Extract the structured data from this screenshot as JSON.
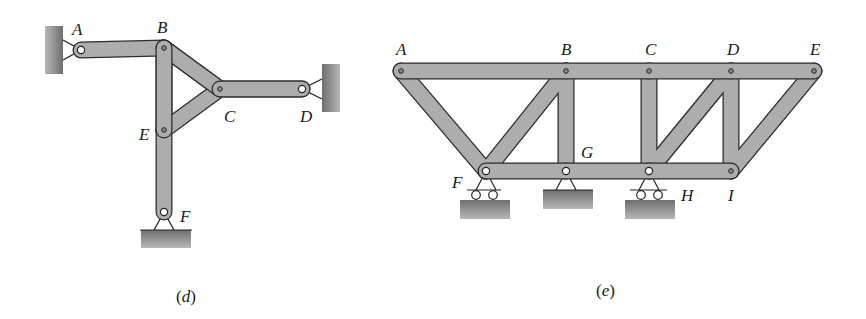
{
  "figures": [
    {
      "id": "d",
      "caption": "(d)",
      "caption_letter": "d",
      "joints": {
        "A": {
          "label": "A",
          "x": 81,
          "y": 50,
          "support": "pin-wall-left"
        },
        "B": {
          "label": "B",
          "x": 164,
          "y": 48
        },
        "C": {
          "label": "C",
          "x": 220,
          "y": 89
        },
        "D": {
          "label": "D",
          "x": 302,
          "y": 89,
          "support": "pin-wall-right"
        },
        "E": {
          "label": "E",
          "x": 164,
          "y": 130
        },
        "F": {
          "label": "F",
          "x": 164,
          "y": 212,
          "support": "pin-ground"
        }
      },
      "members": [
        [
          "A",
          "B"
        ],
        [
          "B",
          "E"
        ],
        [
          "E",
          "F"
        ],
        [
          "B",
          "C"
        ],
        [
          "E",
          "C"
        ],
        [
          "C",
          "D"
        ]
      ]
    },
    {
      "id": "e",
      "caption": "(e)",
      "caption_letter": "e",
      "joints": {
        "A": {
          "label": "A",
          "x": 401,
          "y": 71
        },
        "B": {
          "label": "B",
          "x": 566,
          "y": 71
        },
        "C": {
          "label": "C",
          "x": 649,
          "y": 71
        },
        "D": {
          "label": "D",
          "x": 731,
          "y": 71
        },
        "E": {
          "label": "E",
          "x": 814,
          "y": 71
        },
        "F": {
          "label": "F",
          "x": 486,
          "y": 171,
          "support": "roller"
        },
        "G": {
          "label": "G",
          "x": 566,
          "y": 171,
          "support": "pin"
        },
        "H": {
          "label": "H",
          "x": 649,
          "y": 171,
          "support": "roller"
        },
        "I": {
          "label": "I",
          "x": 731,
          "y": 171
        }
      },
      "members": [
        [
          "A",
          "B"
        ],
        [
          "B",
          "C"
        ],
        [
          "C",
          "D"
        ],
        [
          "D",
          "E"
        ],
        [
          "A",
          "F"
        ],
        [
          "F",
          "B"
        ],
        [
          "B",
          "G"
        ],
        [
          "C",
          "H"
        ],
        [
          "H",
          "D"
        ],
        [
          "D",
          "I"
        ],
        [
          "I",
          "E"
        ],
        [
          "F",
          "G"
        ],
        [
          "G",
          "H"
        ],
        [
          "H",
          "I"
        ]
      ]
    }
  ],
  "colors": {
    "member_fill": "#a9a9a9",
    "member_stroke": "#2b2b2b",
    "ground_fill": "#8a8a8a",
    "pin_fill": "#ffffff",
    "text": "#1a1a1a"
  }
}
